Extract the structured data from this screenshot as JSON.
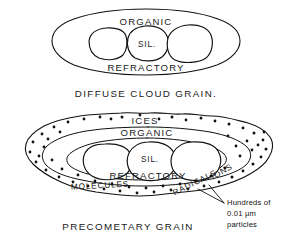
{
  "figure": {
    "title_top": "DIFFUSE CLOUD GRAIN.",
    "title_bottom": "PRECOMETARY GRAIN",
    "background_color": "#ffffff",
    "ink_color": "#111111"
  },
  "diffuse_cloud_grain": {
    "caption": "DIFFUSE CLOUD GRAIN.",
    "layers": [
      {
        "name": "organic",
        "label": "ORGANIC"
      },
      {
        "name": "refractory",
        "label": "REFRACTORY"
      }
    ],
    "core": {
      "label": "SIL.",
      "count": 3
    }
  },
  "precometary_grain": {
    "caption": "PRECOMETARY GRAIN",
    "layers": [
      {
        "name": "ices",
        "label": "ICES"
      },
      {
        "name": "organic",
        "label": "ORGANIC"
      },
      {
        "name": "refractory",
        "label": "REFRACTORY"
      }
    ],
    "core": {
      "label": "SIL.",
      "count": 3
    },
    "mantle_species": [
      {
        "name": "molecules",
        "label": "MOLECULES"
      },
      {
        "name": "radicals",
        "label": "RADICALS"
      },
      {
        "name": "ions",
        "label": "IONS"
      }
    ],
    "annotation": {
      "line1": "Hundreds of",
      "line2": "0.01 µm",
      "line3": "particles"
    }
  }
}
